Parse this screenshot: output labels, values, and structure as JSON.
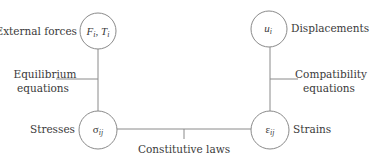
{
  "nodes": {
    "external_forces": {
      "label": "External forces",
      "symbol_main": "F",
      "symbol_sub": "i",
      "symbol_sep": ", ",
      "symbol_main2": "T",
      "symbol_sub2": "i"
    },
    "displacements": {
      "label": "Displacements",
      "symbol_main": "u",
      "symbol_sub": "i"
    },
    "stresses": {
      "label": "Stresses",
      "symbol_main": "σ",
      "symbol_sub": "ij"
    },
    "strains": {
      "label": "Strains",
      "symbol_main": "ε",
      "symbol_sub": "ij"
    }
  },
  "edges": {
    "equilibrium": {
      "line1": "Equilibrium",
      "line2": "equations"
    },
    "compatibility": {
      "line1": "Compatibility",
      "line2": "equations"
    },
    "constitutive": {
      "label": "Constitutive laws"
    }
  }
}
